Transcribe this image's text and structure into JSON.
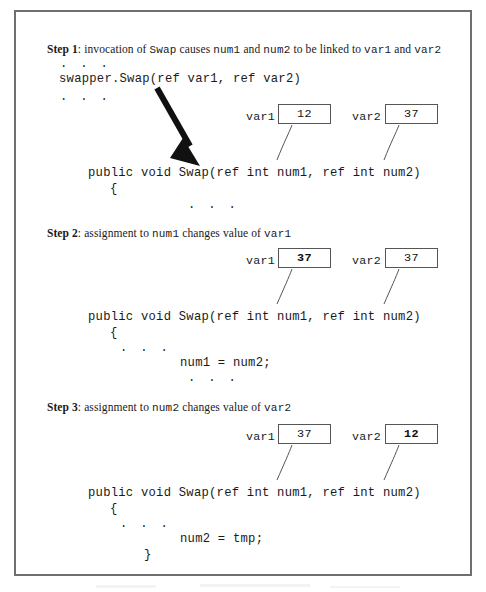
{
  "figure": {
    "caption_visible": false,
    "border_color": "#6f6f6f",
    "box_border_color": "#555555",
    "arrow_color": "#111111"
  },
  "steps": [
    {
      "id": "step-1",
      "label": "Step 1",
      "separator": ": ",
      "parts": [
        {
          "text": "invocation of ",
          "style": "serif"
        },
        {
          "text": "Swap",
          "style": "mono"
        },
        {
          "text": " causes ",
          "style": "serif"
        },
        {
          "text": "num1",
          "style": "mono"
        },
        {
          "text": " and ",
          "style": "serif"
        },
        {
          "text": "num2",
          "style": "mono"
        },
        {
          "text": " to be linked to ",
          "style": "serif"
        },
        {
          "text": "var1",
          "style": "mono"
        },
        {
          "text": " and ",
          "style": "serif"
        },
        {
          "text": "var2",
          "style": "mono"
        }
      ],
      "plain": "Step 1: invocation of Swap causes num1 and num2 to be linked to var1 and var2",
      "code": {
        "ellipsis_top": ". . .",
        "call_line": "swapper.Swap(ref var1, ref var2)",
        "ellipsis_bottom": ". . .",
        "signature": "public void Swap(ref int num1, ref int num2)",
        "open_brace": "{",
        "body_ellipsis": ". . ."
      },
      "vars": [
        {
          "name": "var1",
          "value": "12",
          "changed": false
        },
        {
          "name": "var2",
          "value": "37",
          "changed": false
        }
      ]
    },
    {
      "id": "step-2",
      "label": "Step 2",
      "separator": ": ",
      "parts": [
        {
          "text": "assignment to ",
          "style": "serif"
        },
        {
          "text": "num1",
          "style": "mono"
        },
        {
          "text": " changes value of ",
          "style": "serif"
        },
        {
          "text": "var1",
          "style": "mono"
        }
      ],
      "plain": "Step 2: assignment to num1 changes value of var1",
      "code": {
        "signature": "public void Swap(ref int num1, ref int num2)",
        "open_brace": "{",
        "ellipsis_top": ". . .",
        "statement": "num1 = num2;",
        "ellipsis_bottom": ". . ."
      },
      "vars": [
        {
          "name": "var1",
          "value": "37",
          "changed": true
        },
        {
          "name": "var2",
          "value": "37",
          "changed": false
        }
      ]
    },
    {
      "id": "step-3",
      "label": "Step 3",
      "separator": ": ",
      "parts": [
        {
          "text": "assignment to ",
          "style": "serif"
        },
        {
          "text": "num2",
          "style": "mono"
        },
        {
          "text": " changes value of ",
          "style": "serif"
        },
        {
          "text": "var2",
          "style": "mono"
        }
      ],
      "plain": "Step 3: assignment to num2 changes value of var2",
      "code": {
        "signature": "public void Swap(ref int num1, ref int num2)",
        "open_brace": "{",
        "ellipsis_top": ". . .",
        "statement": "num2 = tmp;",
        "close_brace": "}"
      },
      "vars": [
        {
          "name": "var1",
          "value": "37",
          "changed": false
        },
        {
          "name": "var2",
          "value": "12",
          "changed": true
        }
      ]
    }
  ],
  "annotations": {
    "call_arrow": "arrow pointing from swapper.Swap call down to Swap method definition"
  }
}
